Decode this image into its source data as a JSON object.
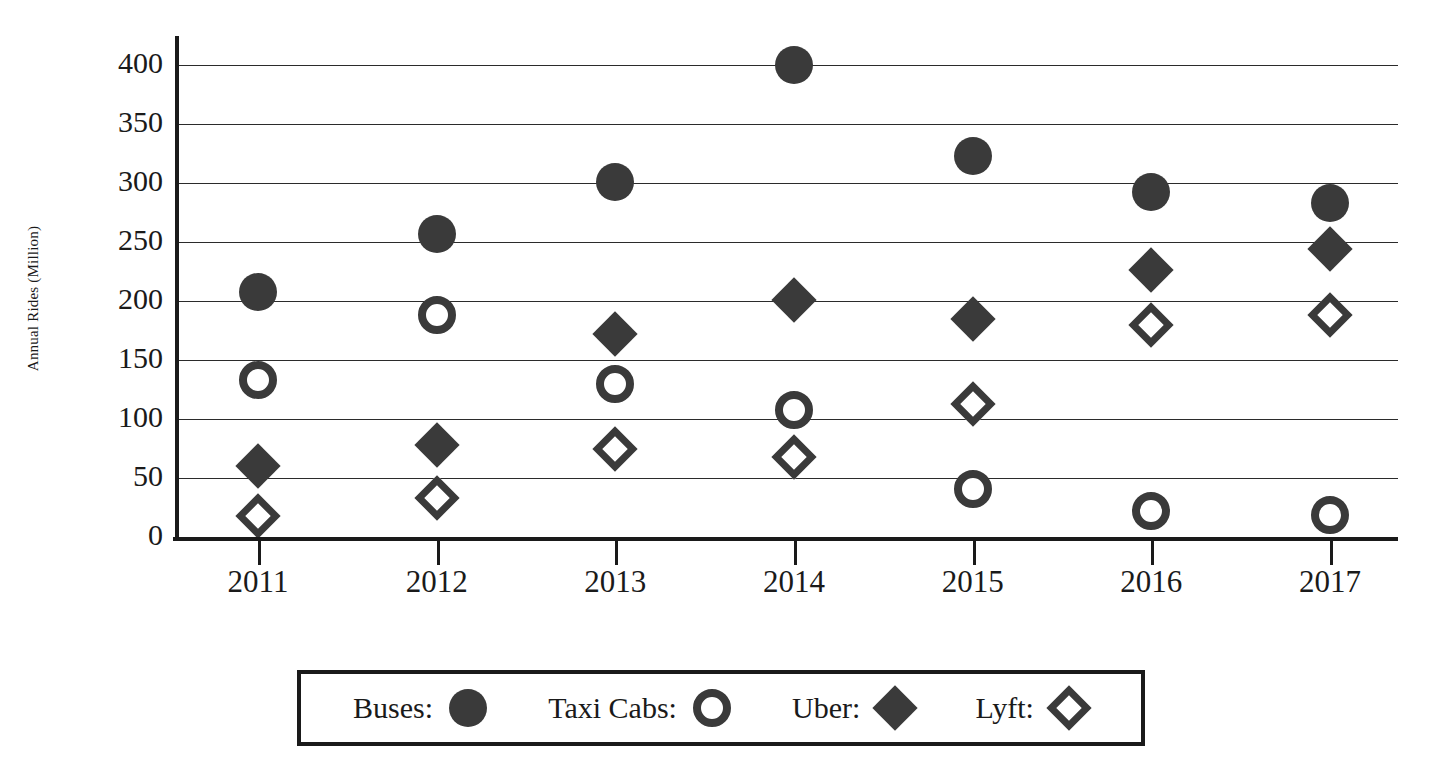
{
  "chart_data": {
    "type": "scatter",
    "title": "",
    "xlabel": "",
    "ylabel": "Annual Rides (Million)",
    "categories": [
      "2011",
      "2012",
      "2013",
      "2014",
      "2015",
      "2016",
      "2017"
    ],
    "x": [
      2011,
      2012,
      2013,
      2014,
      2015,
      2016,
      2017
    ],
    "ylim": [
      0,
      400
    ],
    "yticks": [
      0,
      50,
      100,
      150,
      200,
      250,
      300,
      350,
      400
    ],
    "ytick_labels": [
      "0",
      "50",
      "100",
      "150",
      "200",
      "250",
      "300",
      "350",
      "400"
    ],
    "grid": "horizontal",
    "legend_position": "bottom",
    "series": [
      {
        "name": "Buses",
        "legend_label": "Buses:",
        "marker": "circle-filled",
        "values": [
          208,
          257,
          301,
          400,
          323,
          292,
          283
        ]
      },
      {
        "name": "Taxi Cabs",
        "legend_label": "Taxi Cabs:",
        "marker": "circle-open",
        "values": [
          133,
          188,
          130,
          108,
          41,
          22,
          19
        ]
      },
      {
        "name": "Uber",
        "legend_label": "Uber:",
        "marker": "diamond-filled",
        "values": [
          60,
          78,
          172,
          201,
          185,
          226,
          244
        ]
      },
      {
        "name": "Lyft",
        "legend_label": "Lyft:",
        "marker": "diamond-open",
        "values": [
          18,
          33,
          75,
          68,
          113,
          180,
          188
        ]
      }
    ],
    "colors": {
      "marker": "#3a3a3a",
      "axis": "#1a1a1a",
      "grid": "#2b2b2b",
      "background": "#ffffff"
    }
  }
}
